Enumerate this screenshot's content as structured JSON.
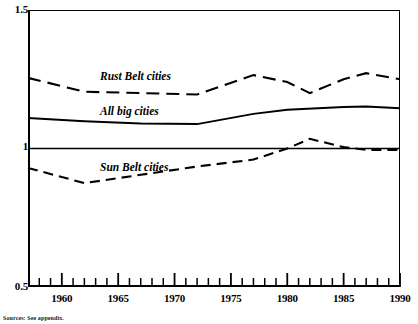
{
  "figure": {
    "source_note": "Sources: See appendix."
  },
  "chart_data": {
    "type": "line",
    "title": "",
    "xlabel": "",
    "ylabel": "",
    "xlim": [
      1957,
      1990
    ],
    "ylim": [
      0.5,
      1.5
    ],
    "grid": false,
    "legend_position": "inline-annotations",
    "y_ticks": [
      "1.5",
      "1",
      "0.5"
    ],
    "y_tick_values": [
      1.5,
      1.0,
      0.5
    ],
    "x_ticks": [
      "1960",
      "1965",
      "1970",
      "1975",
      "1980",
      "1985",
      "1990"
    ],
    "x_tick_values": [
      1960,
      1965,
      1970,
      1975,
      1980,
      1985,
      1990
    ],
    "x_minor_tick_values": [
      1958,
      1959,
      1961,
      1962,
      1963,
      1964,
      1966,
      1967,
      1968,
      1969,
      1971,
      1972,
      1973,
      1974,
      1976,
      1977,
      1978,
      1979,
      1981,
      1982,
      1983,
      1984,
      1986,
      1987,
      1988,
      1989
    ],
    "reference_line": {
      "y": 1.0,
      "style": "solid"
    },
    "series": [
      {
        "name": "Rust Belt cities",
        "style": "long-dash",
        "x": [
          1957,
          1962,
          1967,
          1972,
          1977,
          1980,
          1982,
          1985,
          1987,
          1990
        ],
        "values": [
          1.255,
          1.205,
          1.2,
          1.195,
          1.265,
          1.24,
          1.2,
          1.25,
          1.272,
          1.25
        ]
      },
      {
        "name": "All big cities",
        "style": "solid",
        "x": [
          1957,
          1962,
          1967,
          1972,
          1977,
          1980,
          1985,
          1987,
          1990
        ],
        "values": [
          1.11,
          1.098,
          1.09,
          1.088,
          1.125,
          1.14,
          1.15,
          1.152,
          1.145
        ]
      },
      {
        "name": "Sun Belt cities",
        "style": "dash",
        "x": [
          1957,
          1962,
          1967,
          1972,
          1977,
          1980,
          1982,
          1985,
          1987,
          1990
        ],
        "values": [
          0.93,
          0.875,
          0.905,
          0.935,
          0.96,
          1.0,
          1.035,
          1.005,
          0.995,
          0.995
        ]
      }
    ]
  }
}
